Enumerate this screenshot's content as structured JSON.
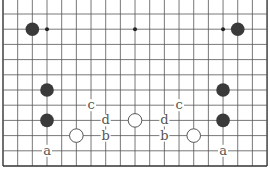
{
  "diagram": {
    "type": "go-board-fragment",
    "grid": {
      "x0": 3,
      "dx": 14.67,
      "cols": 19,
      "y_top": 0,
      "y0": 14,
      "dy": 15.2,
      "rows": 11,
      "line_color": "#555555",
      "edge_color": "#333333"
    },
    "star_points": [
      [
        3,
        1
      ],
      [
        9,
        1
      ],
      [
        15,
        1
      ]
    ],
    "stones": [
      {
        "color": "black",
        "col": 2,
        "row": 1
      },
      {
        "color": "black",
        "col": 16,
        "row": 1
      },
      {
        "color": "black",
        "col": 3,
        "row": 5
      },
      {
        "color": "black",
        "col": 3,
        "row": 7
      },
      {
        "color": "black",
        "col": 15,
        "row": 5
      },
      {
        "color": "black",
        "col": 15,
        "row": 7
      },
      {
        "color": "white",
        "col": 5,
        "row": 8
      },
      {
        "color": "white",
        "col": 9,
        "row": 7
      },
      {
        "color": "white",
        "col": 13,
        "row": 8
      }
    ],
    "labels": [
      {
        "text": "c",
        "col": 6,
        "row": 6
      },
      {
        "text": "d",
        "col": 7,
        "row": 7
      },
      {
        "text": "b",
        "col": 7,
        "row": 8
      },
      {
        "text": "a",
        "col": 3,
        "row": 9
      },
      {
        "text": "c",
        "col": 12,
        "row": 6
      },
      {
        "text": "d",
        "col": 11,
        "row": 7
      },
      {
        "text": "b",
        "col": 11,
        "row": 8
      },
      {
        "text": "a",
        "col": 15,
        "row": 9
      }
    ],
    "colors": {
      "black_stone": "#3a3a3a",
      "white_stone": "#ffffff",
      "white_stroke": "#444444",
      "label": "#555555"
    }
  }
}
